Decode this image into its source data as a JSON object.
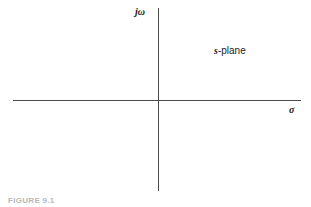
{
  "figure": {
    "background_color": "#ffffff",
    "axis_color": "#4a4a4a",
    "text_color": "#1a1a1a",
    "caption": "FIGURE 9.1"
  },
  "labels": {
    "imaginary_axis": "jω",
    "real_axis": "σ",
    "plane_symbol": "s",
    "plane_suffix": "-plane"
  },
  "chart_data": {
    "type": "diagram",
    "title": "s-plane",
    "xlabel": "σ",
    "ylabel": "jω",
    "origin": [
      0,
      0
    ],
    "grid": false,
    "legend": "none",
    "series": [],
    "annotations": [
      {
        "text": "s-plane",
        "quadrant": "upper-right"
      }
    ]
  }
}
